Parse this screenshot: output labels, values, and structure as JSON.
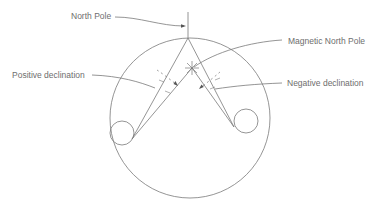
{
  "diagram": {
    "type": "magnetic-declination",
    "labels": {
      "north_pole": "North Pole",
      "magnetic_north_pole": "Magnetic North Pole",
      "positive_declination": "Positive declination",
      "negative_declination": "Negative declination"
    },
    "colors": {
      "line": "#7a7a7a",
      "text": "#6e6e6e",
      "background": "#ffffff"
    }
  }
}
